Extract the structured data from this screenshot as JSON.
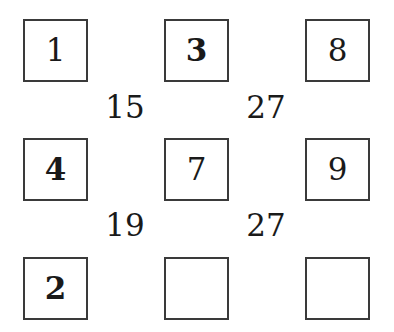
{
  "puzzle": {
    "grid": [
      [
        {
          "value": "1",
          "bold": false
        },
        {
          "value": "3",
          "bold": true
        },
        {
          "value": "8",
          "bold": false
        }
      ],
      [
        {
          "value": "4",
          "bold": true
        },
        {
          "value": "7",
          "bold": false
        },
        {
          "value": "9",
          "bold": false
        }
      ],
      [
        {
          "value": "2",
          "bold": true
        },
        {
          "value": "",
          "bold": false
        },
        {
          "value": "",
          "bold": false
        }
      ]
    ],
    "sums": [
      [
        "15",
        "27"
      ],
      [
        "19",
        "27"
      ]
    ]
  }
}
